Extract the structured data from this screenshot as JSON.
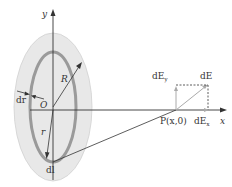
{
  "figure": {
    "labels": {
      "y_axis": "y",
      "x_axis": "x",
      "origin": "O",
      "radius": "R",
      "ring_width": "dr",
      "radius_small": "r",
      "element": "dl",
      "point": "P(x,0)",
      "field": "dE",
      "field_y": "dE",
      "field_y_sub": "y",
      "field_x": "dE",
      "field_x_sub": "x"
    },
    "colors": {
      "disk_fill": "#e6e6e6",
      "ring_stroke": "#9a9a9a",
      "line": "#333333",
      "field_line": "#aaaaaa"
    }
  }
}
